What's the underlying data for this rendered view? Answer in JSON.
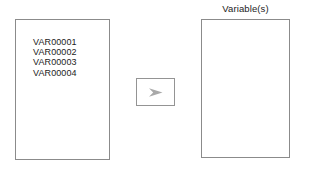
{
  "dialog": {
    "source_list": {
      "name": "source-variable-list",
      "items": [
        {
          "label": "VAR00001"
        },
        {
          "label": "VAR00002"
        },
        {
          "label": "VAR00003"
        },
        {
          "label": "VAR00004"
        }
      ]
    },
    "transfer_button": {
      "icon": "right-arrow-icon",
      "label": "",
      "arrow_color": "#a9a9a9"
    },
    "target": {
      "label": "Variable(s)",
      "items": []
    },
    "colors": {
      "background": "#ffffff",
      "panel_border": "#8b8b8b",
      "button_border": "#949494",
      "text": "#1c1c1c",
      "arrow": "#a9a9a9"
    }
  }
}
